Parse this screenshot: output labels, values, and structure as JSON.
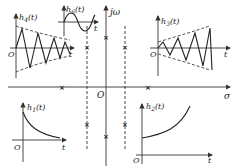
{
  "diagram": {
    "title": "",
    "s_plane": {
      "real_axis_label": "σ",
      "imag_axis_label": "jω",
      "origin_label": "O",
      "pole_marker": "×"
    },
    "panels": {
      "h4": {
        "label": "h",
        "sub": "4",
        "arg": "(t)",
        "origin": "O",
        "t_label": "t",
        "description": "decaying oscillation"
      },
      "h6": {
        "label": "h",
        "sub": "6",
        "arg": "(t)",
        "t_label": "t",
        "description": "sustained sinusoid"
      },
      "h3": {
        "label": "h",
        "sub": "3",
        "arg": "(t)",
        "origin": "O",
        "t_label": "t",
        "description": "growing oscillation"
      },
      "h1": {
        "label": "h",
        "sub": "1",
        "arg": "(t)",
        "origin": "O",
        "t_label": "t",
        "description": "decaying exponential"
      },
      "h2": {
        "label": "h",
        "sub": "2",
        "arg": "(t)",
        "origin": "O",
        "t_label": "t",
        "description": "growing exponential"
      }
    }
  }
}
